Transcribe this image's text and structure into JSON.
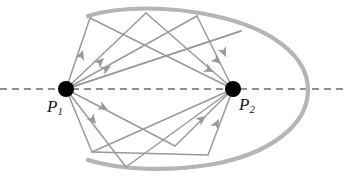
{
  "figure": {
    "width": 345,
    "height": 181,
    "background": "#ffffff",
    "colors": {
      "boundary": "#b5b5b5",
      "ray": "#9a9a9a",
      "arrow": "#9a9a9a",
      "axis_dash": "#6e6e6e",
      "focus_dot": "#000000",
      "label_text": "#1a1a1a"
    }
  },
  "labels": {
    "p1": {
      "symbol": "P",
      "subscript": "1",
      "x": 47,
      "y": 98
    },
    "p2": {
      "symbol": "P",
      "subscript": "2",
      "x": 239,
      "y": 96
    }
  },
  "geometry": {
    "ellipse": {
      "cx": 198,
      "cy": 90,
      "rx": 110,
      "ry": 76,
      "stroke_width": 4,
      "open_gap_left": true,
      "arc_start_deg": 160,
      "arc_end_deg": 200,
      "note": "open C-shaped boundary, gap on the left side"
    },
    "major_axis": {
      "x1": 0,
      "y1": 89,
      "x2": 345,
      "y2": 89,
      "dash": "7,5",
      "stroke_width": 1.6
    },
    "foci": [
      {
        "name": "P1",
        "cx": 66,
        "cy": 89,
        "r": 8
      },
      {
        "name": "P2",
        "cx": 233,
        "cy": 89,
        "r": 8
      }
    ],
    "boundary_vertices": [
      {
        "id": "A",
        "x": 90,
        "y": 18
      },
      {
        "id": "B",
        "x": 146,
        "y": 13
      },
      {
        "id": "C",
        "x": 197,
        "y": 16
      },
      {
        "id": "D",
        "x": 241,
        "y": 31
      },
      {
        "id": "E",
        "x": 208,
        "y": 155
      },
      {
        "id": "F",
        "x": 126,
        "y": 167
      },
      {
        "id": "G",
        "x": 92,
        "y": 152
      },
      {
        "id": "H",
        "x": 175,
        "y": 146
      }
    ],
    "rays": [
      {
        "from": [
          66,
          89
        ],
        "to": [
          90,
          18
        ],
        "arrow_t": 0.72,
        "dir": "to-boundary"
      },
      {
        "from": [
          90,
          18
        ],
        "to": [
          233,
          89
        ],
        "arrow_t": 0.9,
        "dir": "to-focus"
      },
      {
        "from": [
          233,
          89
        ],
        "to": [
          146,
          13
        ],
        "arrow_t": 0.12,
        "dir": "from-focus"
      },
      {
        "from": [
          146,
          13
        ],
        "to": [
          66,
          89
        ],
        "arrow_t": 0.78,
        "dir": "to-focus"
      },
      {
        "from": [
          66,
          89
        ],
        "to": [
          197,
          16
        ],
        "arrow_t": 0.2,
        "dir": "to-boundary"
      },
      {
        "from": [
          197,
          16
        ],
        "to": [
          233,
          89
        ],
        "arrow_t": 0.8,
        "dir": "to-focus"
      },
      {
        "from": [
          66,
          89
        ],
        "to": [
          241,
          31
        ],
        "arrow_t": 0.17,
        "dir": "to-boundary"
      },
      {
        "from": [
          241,
          31
        ],
        "to": [
          66,
          89
        ],
        "arrow_t": 0.82,
        "dir": "to-focus"
      },
      {
        "from": [
          66,
          89
        ],
        "to": [
          126,
          167
        ],
        "arrow_t": 0.38,
        "dir": "to-boundary"
      },
      {
        "from": [
          126,
          167
        ],
        "to": [
          233,
          89
        ],
        "arrow_t": 0.78,
        "dir": "to-focus"
      },
      {
        "from": [
          66,
          89
        ],
        "to": [
          175,
          146
        ],
        "arrow_t": 0.28,
        "dir": "to-boundary"
      },
      {
        "from": [
          175,
          146
        ],
        "to": [
          233,
          89
        ],
        "arrow_t": 0.72,
        "dir": "to-focus"
      },
      {
        "from": [
          208,
          155
        ],
        "to": [
          92,
          152
        ],
        "arrow_t": 0.1,
        "dir": "chord"
      },
      {
        "from": [
          233,
          89
        ],
        "to": [
          208,
          155
        ],
        "arrow_t": 0.05,
        "dir": "from-focus"
      },
      {
        "from": [
          92,
          152
        ],
        "to": [
          233,
          89
        ],
        "arrow_t": 0.88,
        "dir": "to-focus"
      },
      {
        "from": [
          66,
          89
        ],
        "to": [
          92,
          152
        ],
        "arrow_t": 0.55,
        "dir": "to-boundary"
      }
    ]
  }
}
